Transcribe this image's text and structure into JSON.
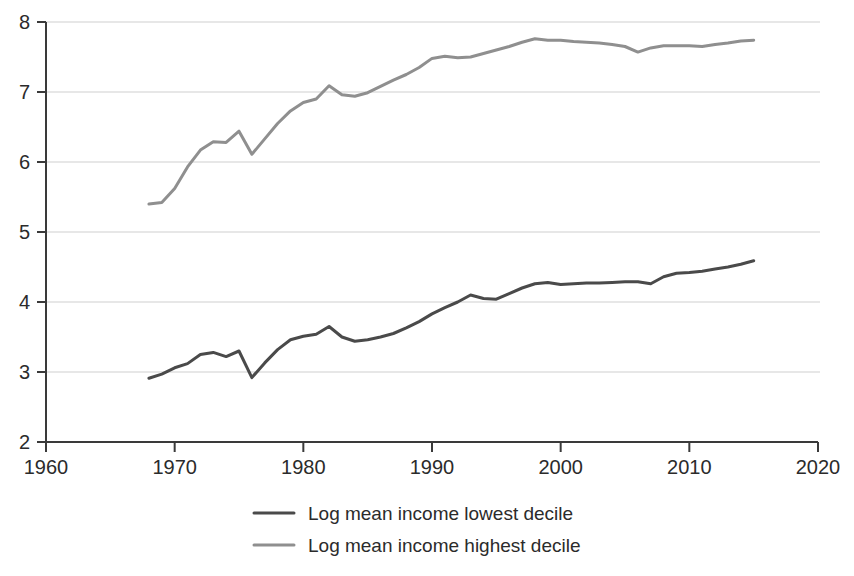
{
  "chart_data": {
    "type": "line",
    "title": "",
    "subtitle": "",
    "xlabel": "",
    "ylabel": "",
    "xlim": [
      1960,
      2020
    ],
    "ylim": [
      2,
      8
    ],
    "xticks": [
      1960,
      1970,
      1980,
      1990,
      2000,
      2010,
      2020
    ],
    "yticks": [
      2,
      3,
      4,
      5,
      6,
      7,
      8
    ],
    "xtick_labels": [
      "1960",
      "1970",
      "1980",
      "1990",
      "2000",
      "2010",
      "2020"
    ],
    "ytick_labels": [
      "2",
      "3",
      "4",
      "5",
      "6",
      "7",
      "8"
    ],
    "grid": true,
    "grid_axis": "y",
    "legend_position": "bottom",
    "x": [
      1968,
      1969,
      1970,
      1971,
      1972,
      1973,
      1974,
      1975,
      1976,
      1977,
      1978,
      1979,
      1980,
      1981,
      1982,
      1983,
      1984,
      1985,
      1986,
      1987,
      1988,
      1989,
      1990,
      1991,
      1992,
      1993,
      1994,
      1995,
      1996,
      1997,
      1998,
      1999,
      2000,
      2001,
      2002,
      2003,
      2004,
      2005,
      2006,
      2007,
      2008,
      2009,
      2010,
      2011,
      2012,
      2013,
      2014,
      2015
    ],
    "series": [
      {
        "name": "Log mean income lowest decile",
        "color": "#4a4a4a",
        "values": [
          2.91,
          2.97,
          3.06,
          3.12,
          3.25,
          3.28,
          3.22,
          3.3,
          2.92,
          3.13,
          3.32,
          3.46,
          3.51,
          3.54,
          3.65,
          3.5,
          3.44,
          3.46,
          3.5,
          3.55,
          3.63,
          3.72,
          3.83,
          3.92,
          4.0,
          4.1,
          4.05,
          4.04,
          4.12,
          4.2,
          4.26,
          4.28,
          4.25,
          4.26,
          4.27,
          4.27,
          4.28,
          4.29,
          4.29,
          4.26,
          4.36,
          4.41,
          4.42,
          4.44,
          4.47,
          4.5,
          4.54,
          4.59
        ]
      },
      {
        "name": "Log mean income highest decile",
        "color": "#8f8f8f",
        "values": [
          5.4,
          5.42,
          5.62,
          5.93,
          6.17,
          6.29,
          6.28,
          6.44,
          6.11,
          6.33,
          6.55,
          6.73,
          6.85,
          6.9,
          7.09,
          6.96,
          6.94,
          6.99,
          7.08,
          7.17,
          7.25,
          7.35,
          7.48,
          7.51,
          7.49,
          7.5,
          7.55,
          7.6,
          7.65,
          7.71,
          7.76,
          7.74,
          7.74,
          7.72,
          7.71,
          7.7,
          7.68,
          7.65,
          7.57,
          7.63,
          7.66,
          7.66,
          7.66,
          7.65,
          7.68,
          7.7,
          7.73,
          7.74
        ]
      }
    ]
  },
  "legend": {
    "entries": [
      {
        "label": "Log mean income lowest decile",
        "color": "#4a4a4a"
      },
      {
        "label": "Log mean income highest decile",
        "color": "#8f8f8f"
      }
    ]
  },
  "axes": {
    "x_ticks": [
      "1960",
      "1970",
      "1980",
      "1990",
      "2000",
      "2010",
      "2020"
    ],
    "y_ticks": [
      "8",
      "7",
      "6",
      "5",
      "4",
      "3",
      "2"
    ]
  }
}
